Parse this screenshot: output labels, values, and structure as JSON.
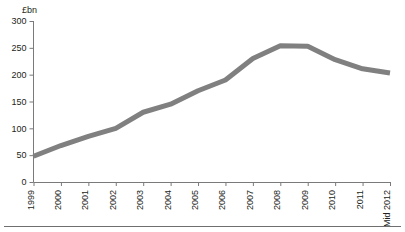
{
  "chart_data": {
    "type": "line",
    "title": "",
    "subtitle": "",
    "xlabel": "",
    "ylabel": "£bn",
    "categories": [
      "1999",
      "2000",
      "2001",
      "2002",
      "2003",
      "2004",
      "2005",
      "2006",
      "2007",
      "2008",
      "2009",
      "2010",
      "2011",
      "Mid 2012"
    ],
    "values": [
      48,
      68,
      85,
      100,
      130,
      145,
      170,
      190,
      230,
      254,
      253,
      228,
      211,
      203
    ],
    "series": [
      {
        "name": "£bn",
        "values": [
          48,
          68,
          85,
          100,
          130,
          145,
          170,
          190,
          230,
          254,
          253,
          228,
          211,
          203
        ],
        "color": "#808080"
      }
    ],
    "ylim": [
      0,
      300
    ],
    "yticks": [
      0,
      50,
      100,
      150,
      200,
      250,
      300
    ],
    "ytick_labels": [
      "0",
      "50",
      "100",
      "150",
      "200",
      "250",
      "300"
    ],
    "grid": false,
    "legend": "none",
    "xtick_rotation": -90,
    "line_width_px": 5
  },
  "axes": {
    "y_axis_label": "£bn",
    "y_tick_labels": [
      "300",
      "250",
      "200",
      "150",
      "100",
      "50",
      "0"
    ],
    "x_tick_labels": [
      "1999",
      "2000",
      "2001",
      "2002",
      "2003",
      "2004",
      "2005",
      "2006",
      "2007",
      "2008",
      "2009",
      "2010",
      "2011",
      "Mid 2012"
    ]
  },
  "colors": {
    "series": "#808080",
    "axis": "#7a7a7a",
    "text": "#231f20",
    "background": "#ffffff",
    "footer_rule": "#6f6f6f"
  }
}
